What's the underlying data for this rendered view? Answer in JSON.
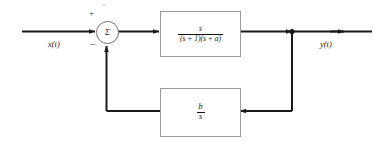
{
  "diagram": {
    "type": "control-system-block-diagram",
    "input": {
      "label": "x(t)"
    },
    "output": {
      "label": "y(t)"
    },
    "summing_junction": {
      "symbol": "Σ",
      "positive_sign": "+",
      "negative_sign": "−",
      "positive_input": "x(t)",
      "negative_input": "feedback"
    },
    "forward_block": {
      "name": "plant-transfer-function",
      "numerator": "s",
      "denominator": "(s + 1)(s + a)",
      "expression": "s / ((s + 1)(s + a))"
    },
    "feedback_block": {
      "name": "feedback-transfer-function",
      "numerator": "b",
      "denominator": "s",
      "expression": "b / s"
    },
    "colors": {
      "wire": "#1a1a1a",
      "block_border": "#9a9a9a",
      "text": "#111111",
      "background": "#ffffff"
    }
  }
}
